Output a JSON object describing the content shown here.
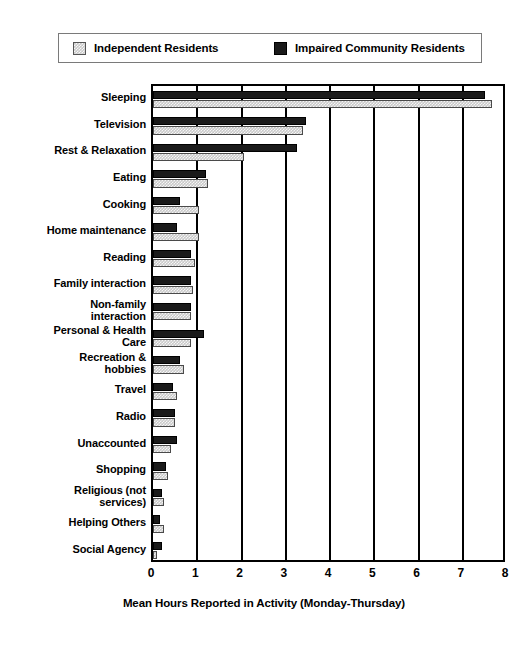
{
  "chart_data": {
    "type": "bar",
    "orientation": "horizontal",
    "title": "",
    "xlabel": "Mean Hours Reported in Activity (Monday-Thursday)",
    "ylabel": "",
    "xlim": [
      0,
      8
    ],
    "xticks": [
      0,
      1,
      2,
      3,
      4,
      5,
      6,
      7,
      8
    ],
    "grid": true,
    "legend_position": "top",
    "categories": [
      "Sleeping",
      "Television",
      "Rest & Relaxation",
      "Eating",
      "Cooking",
      "Home maintenance",
      "Reading",
      "Family interaction",
      "Non-family\ninteraction",
      "Personal & Health\nCare",
      "Recreation &\nhobbies",
      "Travel",
      "Radio",
      "Unaccounted",
      "Shopping",
      "Religious (not\nservices)",
      "Helping Others",
      "Social Agency"
    ],
    "series": [
      {
        "name": "Impaired Community Residents",
        "color": "#1a1a1a",
        "values": [
          7.5,
          3.45,
          3.25,
          1.2,
          0.6,
          0.55,
          0.85,
          0.85,
          0.85,
          1.15,
          0.6,
          0.45,
          0.5,
          0.55,
          0.3,
          0.2,
          0.15,
          0.2
        ]
      },
      {
        "name": "Independent Residents",
        "color": "#c9c9c9",
        "values": [
          7.65,
          3.4,
          2.05,
          1.25,
          1.05,
          1.05,
          0.95,
          0.9,
          0.85,
          0.85,
          0.7,
          0.55,
          0.5,
          0.4,
          0.35,
          0.25,
          0.25,
          0.1
        ]
      }
    ]
  },
  "legend": {
    "entries": [
      {
        "label": "Independent Residents",
        "swatch": "light-hatched-swatch"
      },
      {
        "label": "Impaired Community Residents",
        "swatch": "dark-solid-swatch"
      }
    ]
  }
}
